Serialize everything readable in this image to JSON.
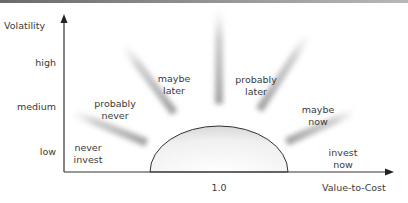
{
  "diagram": {
    "y_axis": {
      "title": "Volatility",
      "ticks": [
        "high",
        "medium",
        "low"
      ]
    },
    "x_axis": {
      "title": "Value-to-Cost",
      "center_tick": "1.0"
    },
    "regions": [
      {
        "line1": "never",
        "line2": "invest"
      },
      {
        "line1": "probably",
        "line2": "never"
      },
      {
        "line1": "maybe",
        "line2": "later"
      },
      {
        "line1": "probably",
        "line2": "later"
      },
      {
        "line1": "maybe",
        "line2": "now"
      },
      {
        "line1": "invest",
        "line2": "now"
      }
    ],
    "colors": {
      "axis": "#333333",
      "ray": "#9a9a9a",
      "text": "#3a3a3a"
    }
  }
}
